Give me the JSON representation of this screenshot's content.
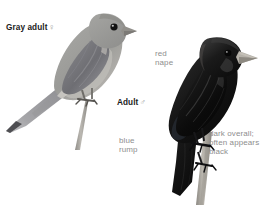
{
  "plate": {
    "background_color": "#ffffff",
    "width": 265,
    "height": 205,
    "kind": "field-guide-bird-identification-plate"
  },
  "labels": {
    "gray_adult": {
      "text": "Gray adult",
      "symbol": "♀",
      "style": "bold",
      "color": "#1a1a1a"
    },
    "adult_male": {
      "text": "Adult",
      "symbol": "♂",
      "style": "bold",
      "color": "#1a1a1a"
    },
    "red_nape": {
      "text": "red\nnape",
      "style": "annotation",
      "color": "#8e8e8e"
    },
    "blue_rump": {
      "text": "blue\nrump",
      "style": "annotation",
      "color": "#8e8e8e"
    },
    "dark_overall": {
      "text": "dark overall;\noften appears\nblack",
      "style": "annotation",
      "color": "#8e8e8e"
    }
  },
  "illustrations": {
    "gray_bird": {
      "name": "gray-adult-female-bird",
      "posture": "perched facing right, long tail angled down-left",
      "body_color": "#9c9c9a",
      "wing_color": "#77777a",
      "belly_color": "#b8b6b2",
      "eye_color": "#141414",
      "bill_color": "#8a8884",
      "perch_color": "#a9a7a2"
    },
    "dark_bird": {
      "name": "adult-male-bird",
      "posture": "perched facing right on branch, tail angled down",
      "body_color": "#161616",
      "wing_color": "#0c0c0c",
      "highlight_color": "#4a4a4a",
      "eye_color": "#0a0a0a",
      "bill_color": "#b3afa7",
      "perch_color": "#a9a59d"
    }
  }
}
